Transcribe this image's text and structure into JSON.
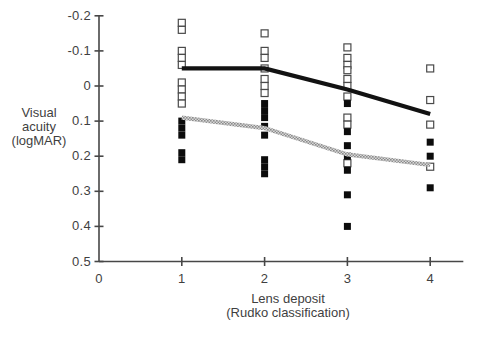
{
  "chart_data": {
    "type": "scatter",
    "x_axis": {
      "label_line1": "Lens deposit",
      "label_line2": "(Rudko classification)",
      "ticks": [
        0,
        1,
        2,
        3,
        4
      ],
      "range": [
        0,
        4.4
      ]
    },
    "y_axis": {
      "label_lines": [
        "Visual",
        "acuity",
        "(logMAR)"
      ],
      "ticks": [
        -0.2,
        -0.1,
        0,
        0.1,
        0.2,
        0.3,
        0.4,
        0.5
      ],
      "range": [
        -0.2,
        0.5
      ],
      "inverted": true
    },
    "grid": false,
    "legend": "none",
    "colors": {
      "axis": "#474747",
      "text": "#3f3f3f",
      "open_marker_stroke": "#4a4a4a",
      "filled_marker": "#0c0c0c",
      "solid_line": "#121212",
      "hatched_line_dark": "#8c8c8c",
      "hatched_line_light": "#d8d8d8"
    },
    "series": [
      {
        "name": "open-squares",
        "marker": "open-square",
        "points": [
          [
            1,
            -0.18
          ],
          [
            1,
            -0.16
          ],
          [
            1,
            -0.1
          ],
          [
            1,
            -0.08
          ],
          [
            1,
            -0.06
          ],
          [
            1,
            -0.01
          ],
          [
            1,
            0.01
          ],
          [
            1,
            0.03
          ],
          [
            1,
            0.05
          ],
          [
            2,
            -0.15
          ],
          [
            2,
            -0.1
          ],
          [
            2,
            -0.08
          ],
          [
            2,
            -0.05
          ],
          [
            2,
            -0.02
          ],
          [
            2,
            0.0
          ],
          [
            2,
            0.02
          ],
          [
            3,
            -0.11
          ],
          [
            3,
            -0.08
          ],
          [
            3,
            -0.06
          ],
          [
            3,
            -0.045
          ],
          [
            3,
            -0.02
          ],
          [
            3,
            0.0
          ],
          [
            3,
            0.03
          ],
          [
            3,
            0.09
          ],
          [
            3,
            0.11
          ],
          [
            3,
            0.22
          ],
          [
            4,
            -0.05
          ],
          [
            4,
            0.04
          ],
          [
            4,
            0.11
          ],
          [
            4,
            0.23
          ]
        ]
      },
      {
        "name": "filled-squares",
        "marker": "filled-square",
        "points": [
          [
            1,
            0.1
          ],
          [
            1,
            0.12
          ],
          [
            1,
            0.14
          ],
          [
            1,
            0.19
          ],
          [
            1,
            0.21
          ],
          [
            2,
            0.05
          ],
          [
            2,
            0.07
          ],
          [
            2,
            0.09
          ],
          [
            2,
            0.115
          ],
          [
            2,
            0.14
          ],
          [
            2,
            0.21
          ],
          [
            2,
            0.23
          ],
          [
            2,
            0.25
          ],
          [
            3,
            0.05
          ],
          [
            3,
            0.13
          ],
          [
            3,
            0.17
          ],
          [
            3,
            0.2
          ],
          [
            3,
            0.24
          ],
          [
            3,
            0.31
          ],
          [
            3,
            0.4
          ],
          [
            4,
            0.16
          ],
          [
            4,
            0.2
          ],
          [
            4,
            0.29
          ]
        ]
      },
      {
        "name": "solid-black-line",
        "marker": "none",
        "line_style": "solid",
        "points": [
          [
            1,
            -0.05
          ],
          [
            2,
            -0.05
          ],
          [
            3,
            0.01
          ],
          [
            4,
            0.08
          ]
        ]
      },
      {
        "name": "hatched-gray-line",
        "marker": "none",
        "line_style": "hatched",
        "points": [
          [
            1,
            0.09
          ],
          [
            2,
            0.12
          ],
          [
            3,
            0.195
          ],
          [
            4,
            0.225
          ]
        ]
      }
    ]
  }
}
